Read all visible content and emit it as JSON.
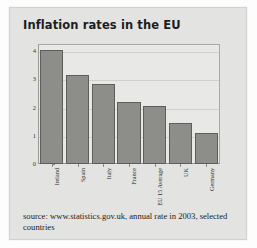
{
  "figure": {
    "title": "Inflation rates in the EU",
    "source_note": "source: www.statistics.gov.uk, annual rate in 2003, selected countries"
  },
  "colors": {
    "bar_fill": "#8d8d8a",
    "bar_stroke": "#5e5e5c",
    "card_background": "#e3e3e1",
    "plot_background": "#e8e8e6",
    "gridline": "#d0d0cd",
    "axis": "#8a8a87",
    "title_text": "#1d1d1d",
    "body_text": "#232321"
  },
  "chart_data": {
    "type": "bar",
    "title": "Inflation rates in the EU",
    "xlabel": "",
    "ylabel": "",
    "categories": [
      "Ireland",
      "Spain",
      "Italy",
      "France",
      "EU 15 Average",
      "UK",
      "Germany"
    ],
    "values": [
      4.05,
      3.15,
      2.85,
      2.2,
      2.05,
      1.45,
      1.1
    ],
    "ylim": [
      0,
      4.25
    ],
    "yticks": [
      0,
      1,
      2,
      3,
      4
    ],
    "ytick_labels": [
      "0",
      "1",
      "2",
      "3",
      "4"
    ],
    "grid": true,
    "legend": null,
    "annotations": [
      "source: www.statistics.gov.uk, annual rate in 2003, selected countries"
    ]
  }
}
